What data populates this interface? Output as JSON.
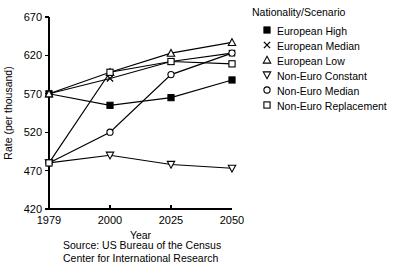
{
  "chart_data": {
    "type": "line",
    "title": "",
    "xlabel": "Year",
    "ylabel": "Rate (per thousand)",
    "categories": [
      "1979",
      "2000",
      "2025",
      "2050"
    ],
    "x_tick_labels": [
      "1979",
      "2000",
      "2025",
      "2050"
    ],
    "y_tick_labels": [
      "420",
      "470",
      "520",
      "570",
      "620",
      "670"
    ],
    "ylim": [
      420,
      670
    ],
    "y_ticks": [
      420,
      470,
      520,
      570,
      620,
      670
    ],
    "grid": false,
    "legend_position": "right",
    "legend_title": "Nationality/Scenario",
    "series": [
      {
        "name": "European High",
        "marker": "filled-square",
        "values": [
          570,
          555,
          565,
          588
        ]
      },
      {
        "name": "European Median",
        "marker": "cross",
        "values": [
          570,
          590,
          612,
          623
        ]
      },
      {
        "name": "European Low",
        "marker": "open-triangle-up",
        "values": [
          570,
          598,
          623,
          637
        ]
      },
      {
        "name": "Non-Euro Constant",
        "marker": "open-triangle-down",
        "values": [
          480,
          490,
          478,
          473
        ]
      },
      {
        "name": "Non-Euro Median",
        "marker": "open-circle",
        "values": [
          480,
          520,
          595,
          623
        ]
      },
      {
        "name": "Non-Euro Replacement",
        "marker": "open-square",
        "values": [
          480,
          598,
          612,
          609
        ]
      }
    ]
  },
  "legend": {
    "title": "Nationality/Scenario",
    "items": [
      {
        "label": "European High",
        "marker": "filled-square"
      },
      {
        "label": "European Median",
        "marker": "cross"
      },
      {
        "label": "European Low",
        "marker": "open-triangle-up"
      },
      {
        "label": "Non-Euro Constant",
        "marker": "open-triangle-down"
      },
      {
        "label": "Non-Euro Median",
        "marker": "open-circle"
      },
      {
        "label": "Non-Euro Replacement",
        "marker": "open-square"
      }
    ]
  },
  "source": {
    "line1": "Source: US Bureau of the Census",
    "line2": "Center for International Research"
  }
}
